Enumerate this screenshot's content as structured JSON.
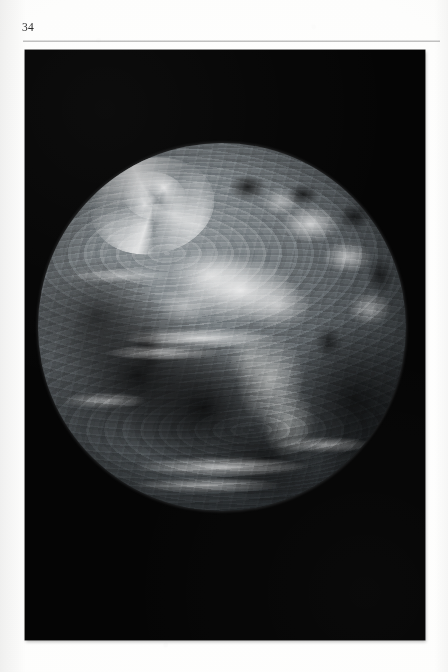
{
  "page": {
    "folio": "34",
    "background_color": "#fdfdfc",
    "width": 448,
    "height": 672
  },
  "head_rule": {
    "color": "#8c8c8c"
  },
  "plate": {
    "kind": "photographic-plate",
    "background_color": "#050505",
    "caption": "",
    "bounds": {
      "x": 25,
      "y": 50,
      "width": 400,
      "height": 590
    }
  },
  "photograph": {
    "subject": "earth-full-disk",
    "rendering": "black-and-white halftone",
    "space_color": "#050505",
    "disk": {
      "center_x": 222,
      "center_y": 333,
      "radius": 184,
      "diameter": 368
    },
    "features": [
      {
        "name": "sahara-desert",
        "tone": "bright",
        "position": "upper-centre"
      },
      {
        "name": "sub-saharan-africa",
        "tone": "mid-grey",
        "position": "centre-right"
      },
      {
        "name": "europe-mediterranean",
        "tone": "bright",
        "position": "upper-right"
      },
      {
        "name": "north-atlantic-cyclone",
        "tone": "bright-spiral",
        "position": "upper-left"
      },
      {
        "name": "south-atlantic-ocean",
        "tone": "dark",
        "position": "lower-left"
      },
      {
        "name": "indian-ocean",
        "tone": "dark",
        "position": "lower-right"
      },
      {
        "name": "southern-storm-belt",
        "tone": "bright-band",
        "position": "bottom"
      },
      {
        "name": "intertropical-convergence-zone",
        "tone": "bright-band",
        "position": "centre"
      }
    ]
  }
}
